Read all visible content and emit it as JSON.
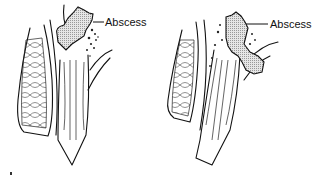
{
  "figure": {
    "panels": [
      {
        "id": "left",
        "label": "Abscess"
      },
      {
        "id": "right",
        "label": "Abscess"
      }
    ],
    "colors": {
      "line": "#111111",
      "background": "#ffffff",
      "fill_pattern": "#bbbbbb"
    }
  }
}
